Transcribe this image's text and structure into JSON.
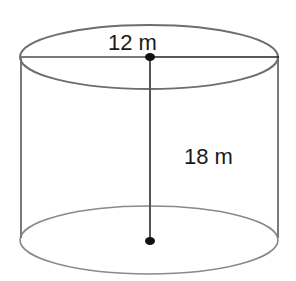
{
  "figure": {
    "shape": "cylinder",
    "diameter_label": "12 m",
    "height_label": "18 m",
    "line_color": "#6e6e6e",
    "dimension_line_color": "#333333",
    "point_color": "#111111"
  }
}
